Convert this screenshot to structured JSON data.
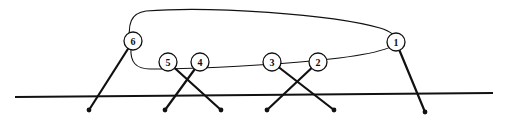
{
  "figure": {
    "name": "knot-diagram",
    "background_color": "#ffffff",
    "stroke_color": "#111111",
    "nodes": [
      {
        "id": "1",
        "label": "1",
        "cx": 396,
        "cy": 42,
        "r": 9
      },
      {
        "id": "2",
        "label": "2",
        "cx": 318,
        "cy": 62,
        "r": 9
      },
      {
        "id": "3",
        "label": "3",
        "cx": 272,
        "cy": 62,
        "r": 9
      },
      {
        "id": "4",
        "label": "4",
        "cx": 200,
        "cy": 62,
        "r": 9
      },
      {
        "id": "5",
        "label": "5",
        "cx": 168,
        "cy": 62,
        "r": 9
      },
      {
        "id": "6",
        "label": "6",
        "cx": 133,
        "cy": 41,
        "r": 9
      }
    ],
    "baseline": {
      "x1": 15,
      "y1": 97,
      "x2": 493,
      "y2": 93
    },
    "strands": [
      {
        "from": "6",
        "to_x": 89,
        "to_y": 110
      },
      {
        "from": "5",
        "to_x": 221,
        "to_y": 110
      },
      {
        "from": "4",
        "to_x": 165,
        "to_y": 110
      },
      {
        "from": "3",
        "to_x": 334,
        "to_y": 110
      },
      {
        "from": "2",
        "to_x": 267,
        "to_y": 110
      },
      {
        "from": "1",
        "to_x": 425,
        "to_y": 112
      }
    ],
    "loop_top_path": "M 131 48 C 126 22 132 13 146 11 C 210 6 330 14 380 28 C 393 32 397 37 398 42",
    "loop_bottom_path": "M 398 42 C 392 50 360 57 300 62 C 250 66 190 69 150 69 C 136 69 130 62 131 48",
    "endpoint_radius": 2.4,
    "line_width_thin": 1.1,
    "line_width_thick": 2.2,
    "line_width_base": 2.0
  }
}
